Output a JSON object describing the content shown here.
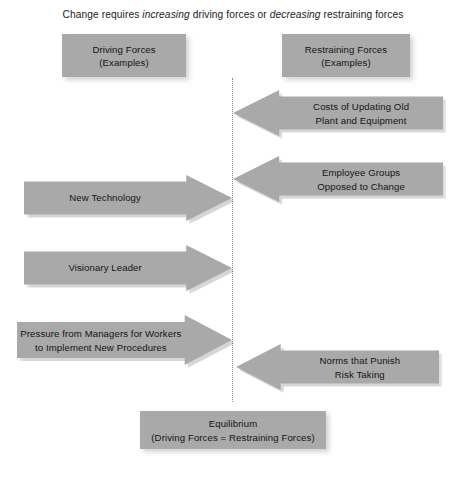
{
  "title": {
    "lead": "Change requires ",
    "em1": "increasing",
    "mid": " driving forces or ",
    "em2": "decreasing",
    "tail": " restraining forces"
  },
  "colors": {
    "shape_fill": "#a9a9a9",
    "text": "#141414",
    "center_line": "#8a8a8a",
    "background": "#ffffff"
  },
  "headers": {
    "driving": {
      "line1": "Driving Forces",
      "line2": "(Examples)"
    },
    "restraining": {
      "line1": "Restraining Forces",
      "line2": "(Examples)"
    }
  },
  "driving_forces": [
    {
      "line1": "New Technology",
      "line2": ""
    },
    {
      "line1": "Visionary Leader",
      "line2": ""
    },
    {
      "line1": "Pressure from Managers for Workers",
      "line2": "to Implement New Procedures"
    }
  ],
  "restraining_forces": [
    {
      "line1": "Costs of Updating Old",
      "line2": "Plant and Equipment"
    },
    {
      "line1": "Employee Groups",
      "line2": "Opposed to Change"
    },
    {
      "line1": "Norms that Punish",
      "line2": "Risk Taking"
    }
  ],
  "equilibrium": {
    "line1": "Equilibrium",
    "line2": "(Driving Forces = Restraining Forces)"
  }
}
